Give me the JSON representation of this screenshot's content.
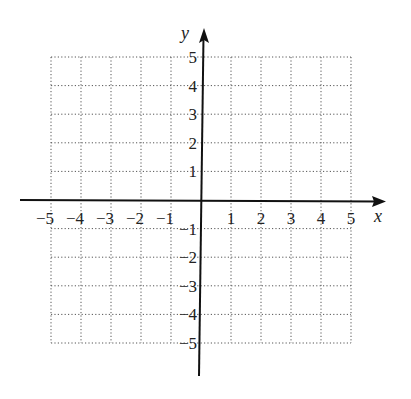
{
  "chart_data": {
    "type": "scatter",
    "title": "",
    "xlabel": "x",
    "ylabel": "y",
    "xlim": [
      -5,
      5
    ],
    "ylim": [
      -5,
      5
    ],
    "grid": true,
    "grid_style": "dotted",
    "x_ticks": [
      "-5",
      "-4",
      "-3",
      "-2",
      "-1",
      "1",
      "2",
      "3",
      "4",
      "5"
    ],
    "y_ticks": [
      "5",
      "4",
      "3",
      "2",
      "1",
      "-1",
      "-2",
      "-3",
      "-4",
      "-5"
    ],
    "series": [],
    "legend": null
  },
  "colors": {
    "axis": "#111111",
    "grid": "#555555",
    "text": "#222222"
  }
}
